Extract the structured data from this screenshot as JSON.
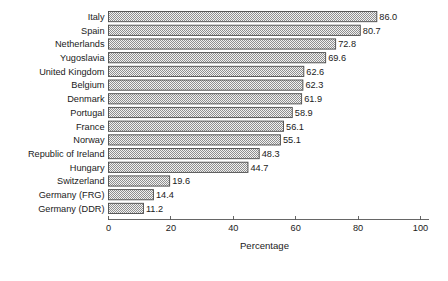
{
  "chart_data": {
    "type": "bar",
    "orientation": "horizontal",
    "title": "",
    "xlabel": "Percentage",
    "ylabel": "",
    "xlim": [
      0,
      100
    ],
    "xticks": [
      0,
      20,
      40,
      60,
      80,
      100
    ],
    "xtick_labels": [
      "0",
      "20",
      "40",
      "60",
      "80",
      "100"
    ],
    "grid": false,
    "legend": null,
    "value_labels": true,
    "bar_fill": "#b8b8b8",
    "bar_pattern": "checker-stipple",
    "bar_edge_color": "#4a4a4a",
    "background": "#ffffff",
    "categories": [
      "Italy",
      "Spain",
      "Netherlands",
      "Yugoslavia",
      "United Kingdom",
      "Belgium",
      "Denmark",
      "Portugal",
      "France",
      "Norway",
      "Republic of Ireland",
      "Hungary",
      "Switzerland",
      "Germany (FRG)",
      "Germany (DDR)"
    ],
    "values": [
      86.0,
      80.7,
      72.8,
      69.6,
      62.6,
      62.3,
      61.9,
      58.9,
      56.1,
      55.1,
      48.3,
      44.7,
      19.6,
      14.4,
      11.2
    ],
    "value_label_texts": [
      "86.0",
      "80.7",
      "72.8",
      "69.6",
      "62.6",
      "62.3",
      "61.9",
      "58.9",
      "56.1",
      "55.1",
      "48.3",
      "44.7",
      "19.6",
      "14.4",
      "11.2"
    ]
  }
}
